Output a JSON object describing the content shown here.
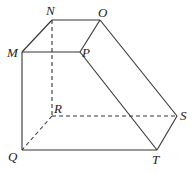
{
  "diagram": {
    "type": "3d-solid",
    "stroke_color": "#333333",
    "vertices": {
      "N": {
        "label": "N",
        "x": 52,
        "y": 20,
        "lx": 46,
        "ly": 14
      },
      "O": {
        "label": "O",
        "x": 100,
        "y": 20,
        "lx": 99,
        "ly": 16
      },
      "M": {
        "label": "M",
        "x": 22,
        "y": 52,
        "lx": 8,
        "ly": 57
      },
      "P": {
        "label": "P",
        "x": 80,
        "y": 52,
        "lx": 83,
        "ly": 57
      },
      "R": {
        "label": "R",
        "x": 52,
        "y": 116,
        "lx": 54,
        "ly": 113
      },
      "S": {
        "label": "S",
        "x": 177,
        "y": 116,
        "lx": 180,
        "ly": 120
      },
      "Q": {
        "label": "Q",
        "x": 22,
        "y": 150,
        "lx": 8,
        "ly": 161
      },
      "T": {
        "label": "T",
        "x": 157,
        "y": 150,
        "lx": 153,
        "ly": 164
      }
    },
    "solid_edges": [
      [
        "M",
        "N"
      ],
      [
        "N",
        "O"
      ],
      [
        "O",
        "P"
      ],
      [
        "M",
        "P"
      ],
      [
        "M",
        "Q"
      ],
      [
        "Q",
        "T"
      ],
      [
        "P",
        "T"
      ],
      [
        "O",
        "S"
      ],
      [
        "S",
        "T"
      ]
    ],
    "dashed_edges": [
      [
        "N",
        "R"
      ],
      [
        "R",
        "S"
      ],
      [
        "R",
        "Q"
      ]
    ]
  }
}
